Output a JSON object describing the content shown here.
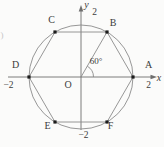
{
  "figure": {
    "colors": {
      "bg": "#fbfbfa",
      "line": "#8b8b8b",
      "axis": "#6e6e6e",
      "text": "#3b3b3b",
      "marker": "#1c1c1c"
    },
    "axes": {
      "x_label": "x",
      "y_label": "y",
      "origin_label": "O"
    },
    "ticks": {
      "x_pos": "2",
      "x_neg": "−2",
      "y_pos": "2",
      "y_neg": "−2"
    },
    "angle": {
      "label": "60°",
      "value_degrees": 60,
      "vertex": "O",
      "between": [
        "OA",
        "OB"
      ]
    },
    "circle": {
      "center": [
        0,
        0
      ],
      "radius": 2
    },
    "hexagon_points": [
      {
        "label": "A",
        "coords": [
          2,
          0
        ]
      },
      {
        "label": "B",
        "coords": [
          1,
          1.73
        ]
      },
      {
        "label": "C",
        "coords": [
          -1,
          1.73
        ]
      },
      {
        "label": "D",
        "coords": [
          -2,
          0
        ]
      },
      {
        "label": "E",
        "coords": [
          -1,
          -1.73
        ]
      },
      {
        "label": "F",
        "coords": [
          1,
          -1.73
        ]
      }
    ],
    "drawn_segments": [
      "AB",
      "BC",
      "CD",
      "DE",
      "EF",
      "FA",
      "OB"
    ],
    "edge_artifact": ")"
  }
}
